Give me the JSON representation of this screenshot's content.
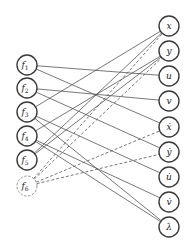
{
  "diagram": {
    "type": "bipartite-graph",
    "colors": {
      "stroke": "#3a3a3a",
      "edge": "#555555",
      "background": "#ffffff"
    },
    "node_radius": 10,
    "left_nodes": [
      {
        "id": "f1",
        "base": "f",
        "sub": "1",
        "x": 27,
        "y": 65,
        "dashed": false
      },
      {
        "id": "f2",
        "base": "f",
        "sub": "2",
        "x": 27,
        "y": 88,
        "dashed": false
      },
      {
        "id": "f3",
        "base": "f",
        "sub": "3",
        "x": 27,
        "y": 112,
        "dashed": false
      },
      {
        "id": "f4",
        "base": "f",
        "sub": "4",
        "x": 27,
        "y": 136,
        "dashed": false
      },
      {
        "id": "f5",
        "base": "f",
        "sub": "5",
        "x": 27,
        "y": 160,
        "dashed": false
      },
      {
        "id": "f6",
        "base": "f",
        "sub": "6",
        "x": 27,
        "y": 186,
        "dashed": true
      }
    ],
    "right_nodes": [
      {
        "id": "x",
        "label": "x",
        "x": 169,
        "y": 26
      },
      {
        "id": "y",
        "label": "y",
        "x": 169,
        "y": 51
      },
      {
        "id": "u",
        "label": "u",
        "x": 169,
        "y": 76
      },
      {
        "id": "v",
        "label": "v",
        "x": 169,
        "y": 101
      },
      {
        "id": "xdot",
        "label": "ẋ",
        "x": 169,
        "y": 127
      },
      {
        "id": "ydot",
        "label": "ẏ",
        "x": 169,
        "y": 152
      },
      {
        "id": "udot",
        "label": "u̇",
        "x": 169,
        "y": 177
      },
      {
        "id": "vdot",
        "label": "v̇",
        "x": 169,
        "y": 202
      },
      {
        "id": "lambda",
        "label": "λ",
        "x": 169,
        "y": 227
      }
    ],
    "edges": [
      {
        "from": "f1",
        "to": "u",
        "dashed": false
      },
      {
        "from": "f1",
        "to": "xdot",
        "dashed": false
      },
      {
        "from": "f2",
        "to": "v",
        "dashed": false
      },
      {
        "from": "f2",
        "to": "ydot",
        "dashed": false
      },
      {
        "from": "f3",
        "to": "x",
        "dashed": false
      },
      {
        "from": "f3",
        "to": "udot",
        "dashed": false
      },
      {
        "from": "f3",
        "to": "lambda",
        "dashed": false
      },
      {
        "from": "f4",
        "to": "y",
        "dashed": false
      },
      {
        "from": "f4",
        "to": "vdot",
        "dashed": false
      },
      {
        "from": "f4",
        "to": "lambda",
        "dashed": false
      },
      {
        "from": "f5",
        "to": "x",
        "dashed": false
      },
      {
        "from": "f5",
        "to": "y",
        "dashed": false
      },
      {
        "from": "f6",
        "to": "x",
        "dashed": true
      },
      {
        "from": "f6",
        "to": "y",
        "dashed": true
      },
      {
        "from": "f6",
        "to": "xdot",
        "dashed": true
      },
      {
        "from": "f6",
        "to": "ydot",
        "dashed": true
      }
    ]
  }
}
